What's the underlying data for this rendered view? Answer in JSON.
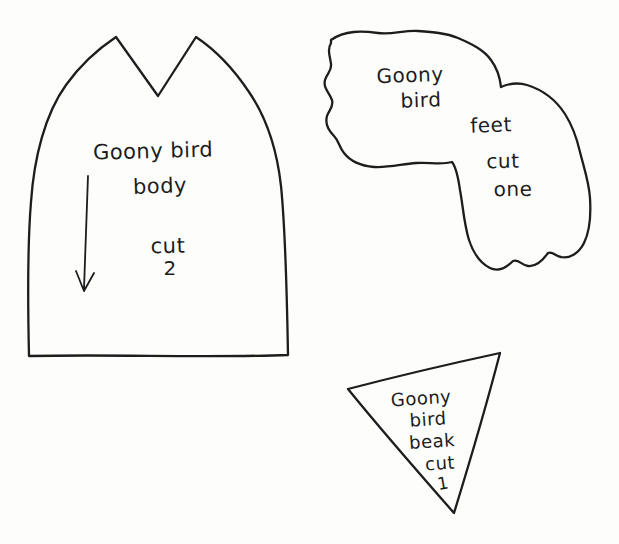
{
  "document": {
    "type": "hand-drawn craft pattern sheet",
    "colors": {
      "ink": "#1d1d1d",
      "paper": "#fdfdfc"
    },
    "icons": {
      "body_grain_arrow": "down-arrow"
    }
  },
  "patterns": {
    "body": {
      "name_line1": "Goony bird",
      "name_line2": "body",
      "cut_label": "cut",
      "cut_count": "2"
    },
    "feet": {
      "name_line1": "Goony",
      "name_line2": "bird",
      "part_label": "feet",
      "cut_label": "cut",
      "cut_count": "one"
    },
    "beak": {
      "name_line1": "Goony",
      "name_line2": "bird",
      "part_label": "beak",
      "cut_label": "cut",
      "cut_count": "1"
    }
  }
}
